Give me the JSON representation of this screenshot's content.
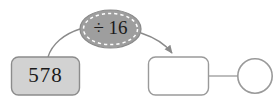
{
  "diagram": {
    "type": "function-machine",
    "input_box": {
      "value": "578",
      "fill": "#d2d2d2",
      "stroke": "#8c8c8c"
    },
    "operation_bubble": {
      "label": "÷ 16",
      "operator": "÷",
      "operand": "16",
      "fill": "#9e9e9e",
      "stroke": "#8a8a8a",
      "dash_color": "#ffffff"
    },
    "output_box": {
      "value": "",
      "fill": "#ffffff",
      "stroke": "#9a9a9a"
    },
    "remainder_circle": {
      "value": "",
      "fill": "#ffffff",
      "stroke": "#9a9a9a"
    },
    "connector_in": {
      "name": "input-to-operation-curve",
      "arrowhead": false,
      "stroke": "#8a8a8a"
    },
    "connector_out": {
      "name": "operation-to-output-arrow",
      "arrowhead": true,
      "stroke": "#8a8a8a"
    },
    "connector_link": {
      "name": "output-to-remainder-line",
      "arrowhead": false,
      "stroke": "#9a9a9a"
    }
  }
}
